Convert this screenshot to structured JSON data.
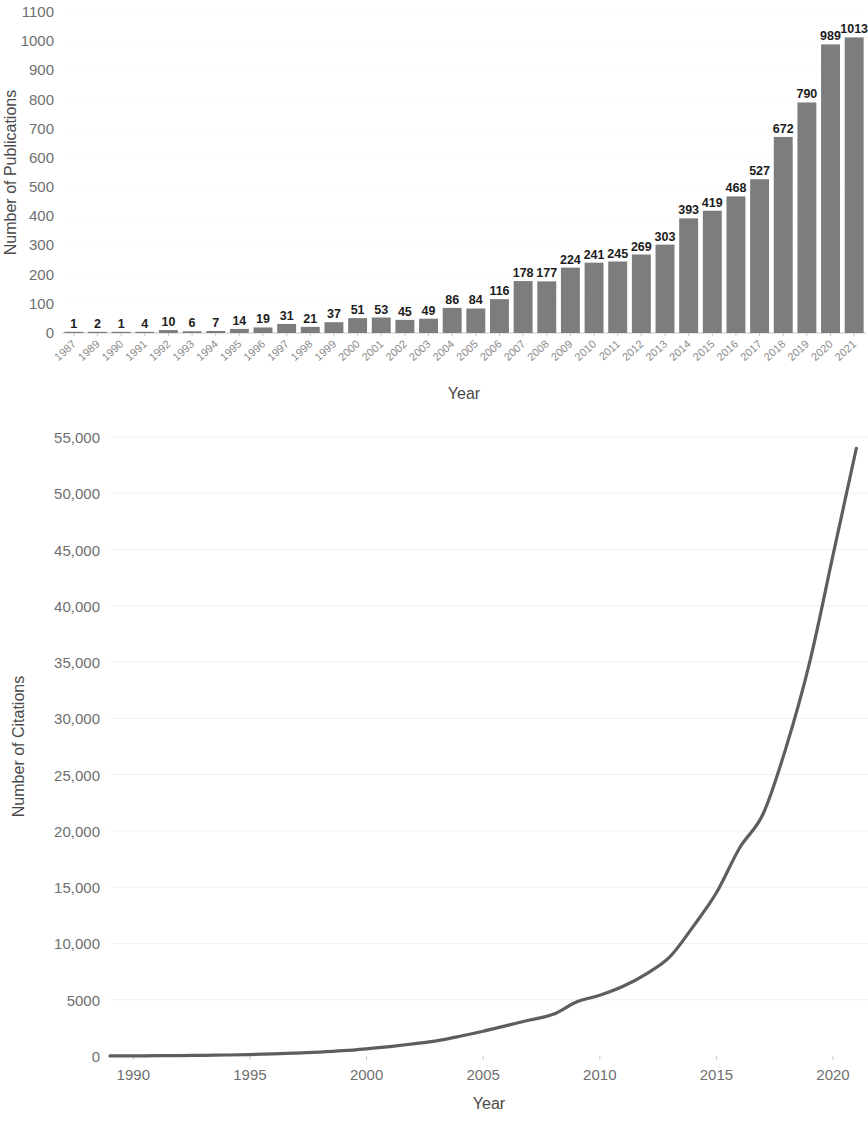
{
  "chart_data": [
    {
      "type": "bar",
      "id": "publications-per-year",
      "title": "",
      "xlabel": "Year",
      "ylabel": "Number of Publications",
      "ylim": [
        0,
        1100
      ],
      "yticks": [
        0,
        100,
        200,
        300,
        400,
        500,
        600,
        700,
        800,
        900,
        1000,
        1100
      ],
      "ytick_labels": [
        "0",
        "100",
        "200",
        "300",
        "400",
        "500",
        "600",
        "700",
        "800",
        "900",
        "1000",
        "1100"
      ],
      "grid": false,
      "legend": "none",
      "bar_color": "#7d7d7d",
      "data_labels": true,
      "categories": [
        "1987",
        "1989",
        "1990",
        "1991",
        "1992",
        "1993",
        "1994",
        "1995",
        "1996",
        "1997",
        "1998",
        "1999",
        "2000",
        "2001",
        "2002",
        "2003",
        "2004",
        "2005",
        "2006",
        "2007",
        "2008",
        "2009",
        "2010",
        "2011",
        "2012",
        "2013",
        "2014",
        "2015",
        "2016",
        "2017",
        "2018",
        "2019",
        "2020",
        "2021"
      ],
      "values": [
        1,
        2,
        1,
        4,
        10,
        6,
        7,
        14,
        19,
        31,
        21,
        37,
        51,
        53,
        45,
        49,
        86,
        84,
        116,
        178,
        177,
        224,
        241,
        245,
        269,
        303,
        393,
        419,
        468,
        527,
        672,
        790,
        989,
        1013
      ]
    },
    {
      "type": "line",
      "id": "citations-per-year",
      "title": "",
      "xlabel": "Year",
      "ylabel": "Number of Citations",
      "ylim": [
        0,
        55000
      ],
      "yticks": [
        0,
        5000,
        10000,
        15000,
        20000,
        25000,
        30000,
        35000,
        40000,
        45000,
        50000,
        55000
      ],
      "ytick_labels": [
        "0",
        "5000",
        "10,000",
        "15,000",
        "20,000",
        "25,000",
        "30,000",
        "35,000",
        "40,000",
        "45,000",
        "50,000",
        "55,000"
      ],
      "xlim": [
        1989,
        2021.5
      ],
      "xticks": [
        1990,
        1995,
        2000,
        2005,
        2010,
        2015,
        2020
      ],
      "xtick_labels": [
        "1990",
        "1995",
        "2000",
        "2005",
        "2010",
        "2015",
        "2020"
      ],
      "grid": true,
      "legend": "none",
      "line_color": "#5e5e5e",
      "x": [
        1989,
        1990,
        1991,
        1992,
        1993,
        1994,
        1995,
        1996,
        1997,
        1998,
        1999,
        2000,
        2001,
        2002,
        2003,
        2004,
        2005,
        2006,
        2007,
        2008,
        2009,
        2010,
        2011,
        2012,
        2013,
        2014,
        2015,
        2016,
        2017,
        2018,
        2019,
        2020,
        2021
      ],
      "values": [
        10,
        15,
        25,
        40,
        60,
        90,
        130,
        190,
        260,
        350,
        470,
        640,
        840,
        1080,
        1350,
        1750,
        2200,
        2700,
        3200,
        3700,
        4800,
        5400,
        6200,
        7300,
        8800,
        11500,
        14500,
        18500,
        21500,
        27500,
        35000,
        44500,
        54000
      ]
    }
  ],
  "panels": {
    "bar": {
      "ylabel": "Number of Publications",
      "xlabel": "Year"
    },
    "line": {
      "ylabel": "Number of Citations",
      "xlabel": "Year"
    }
  }
}
